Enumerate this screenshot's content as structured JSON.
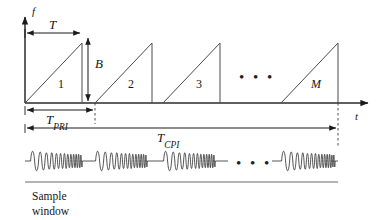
{
  "figure": {
    "axes": {
      "y_label": "f",
      "x_label": "t"
    },
    "dimensions": {
      "sweep_time": "T",
      "bandwidth": "B",
      "pri_symbol": "T",
      "pri_subscript": "PRI",
      "cpi_symbol": "T",
      "cpi_subscript": "CPI"
    },
    "pulses": {
      "labels": [
        "1",
        "2",
        "3",
        "M"
      ],
      "ellipsis": "• • •",
      "count_symbol": "M"
    },
    "waveform": {
      "ellipsis": "• • •",
      "caption_line1": "Sample",
      "caption_line2": "window"
    },
    "colors": {
      "ink": "#151515",
      "line": "#3a3a3a",
      "axis": "#2b2b2b",
      "background": "#ffffff"
    }
  }
}
